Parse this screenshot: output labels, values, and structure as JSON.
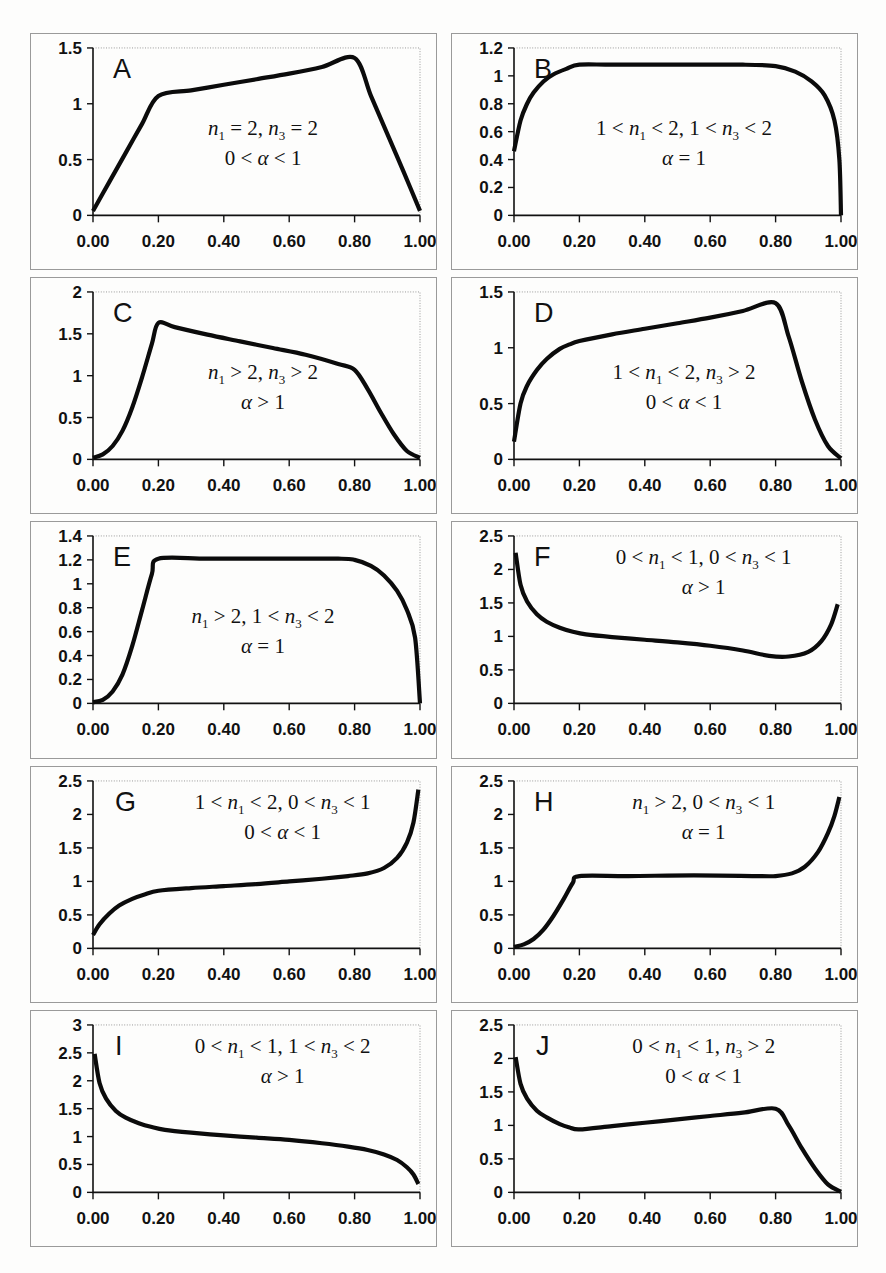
{
  "figure": {
    "background_color": "#fdfdfc",
    "curve_color": "#0b0b0b",
    "axis_color": "#111111",
    "frame_color": "#9a9a9a",
    "panel_count": 10,
    "columns": 2,
    "rows": 5
  },
  "chart_data": [
    {
      "id": "A",
      "type": "line",
      "letter": "A",
      "title": "",
      "xlabel": "",
      "ylabel": "",
      "xlim": [
        0.0,
        1.0
      ],
      "ylim": [
        0.0,
        1.5
      ],
      "xticks": [
        0.0,
        0.2,
        0.4,
        0.6,
        0.8,
        1.0
      ],
      "xtick_labels": [
        "0.00",
        "0.20",
        "0.40",
        "0.60",
        "0.80",
        "1.00"
      ],
      "yticks": [
        0,
        0.5,
        1,
        1.5
      ],
      "ytick_labels": [
        "0",
        "0.5",
        "1",
        "1.5"
      ],
      "grid": false,
      "legend": "none",
      "annotation_line1": "n₁ = 2, n₃ = 2",
      "annotation_line2": "0 < α < 1",
      "annotation_parts": [
        {
          "var1": "n",
          "sub1": "1",
          "rel1": " = 2, ",
          "var2": "n",
          "sub2": "3",
          "rel2": " = 2"
        },
        {
          "alpha_expr": "0 < α < 1"
        }
      ],
      "x": [
        0.0,
        0.05,
        0.1,
        0.15,
        0.2,
        0.3,
        0.4,
        0.5,
        0.6,
        0.7,
        0.8,
        0.85,
        0.9,
        0.95,
        1.0
      ],
      "y": [
        0.04,
        0.3,
        0.56,
        0.82,
        1.07,
        1.12,
        1.17,
        1.22,
        1.27,
        1.33,
        1.41,
        1.07,
        0.73,
        0.39,
        0.04
      ]
    },
    {
      "id": "B",
      "type": "line",
      "letter": "B",
      "title": "",
      "xlabel": "",
      "ylabel": "",
      "xlim": [
        0.0,
        1.0
      ],
      "ylim": [
        0.0,
        1.2
      ],
      "xticks": [
        0.0,
        0.2,
        0.4,
        0.6,
        0.8,
        1.0
      ],
      "xtick_labels": [
        "0.00",
        "0.20",
        "0.40",
        "0.60",
        "0.80",
        "1.00"
      ],
      "yticks": [
        0,
        0.2,
        0.4,
        0.6,
        0.8,
        1,
        1.2
      ],
      "ytick_labels": [
        "0",
        "0.2",
        "0.4",
        "0.6",
        "0.8",
        "1",
        "1.2"
      ],
      "grid": false,
      "legend": "none",
      "annotation_line1": "1 < n₁ < 2, 1 < n₃ < 2",
      "annotation_line2": "α = 1",
      "annotation_parts": [
        {
          "pre1": "1 < ",
          "var1": "n",
          "sub1": "1",
          "rel1": " < 2, 1 < ",
          "var2": "n",
          "sub2": "3",
          "rel2": " < 2"
        },
        {
          "alpha_expr": "α = 1"
        }
      ],
      "x": [
        0.0,
        0.02,
        0.04,
        0.06,
        0.09,
        0.12,
        0.16,
        0.2,
        0.3,
        0.5,
        0.7,
        0.8,
        0.86,
        0.91,
        0.95,
        0.98,
        0.995,
        1.0
      ],
      "y": [
        0.46,
        0.68,
        0.8,
        0.88,
        0.96,
        1.01,
        1.05,
        1.08,
        1.08,
        1.08,
        1.08,
        1.07,
        1.03,
        0.96,
        0.86,
        0.68,
        0.4,
        0.0
      ]
    },
    {
      "id": "C",
      "type": "line",
      "letter": "C",
      "title": "",
      "xlabel": "",
      "ylabel": "",
      "xlim": [
        0.0,
        1.0
      ],
      "ylim": [
        0.0,
        2.0
      ],
      "xticks": [
        0.0,
        0.2,
        0.4,
        0.6,
        0.8,
        1.0
      ],
      "xtick_labels": [
        "0.00",
        "0.20",
        "0.40",
        "0.60",
        "0.80",
        "1.00"
      ],
      "yticks": [
        0,
        0.5,
        1,
        1.5,
        2
      ],
      "ytick_labels": [
        "0",
        "0.5",
        "1",
        "1.5",
        "2"
      ],
      "grid": false,
      "legend": "none",
      "annotation_line1": "n₁ > 2, n₃ > 2",
      "annotation_line2": "α > 1",
      "annotation_parts": [
        {
          "var1": "n",
          "sub1": "1",
          "rel1": " > 2, ",
          "var2": "n",
          "sub2": "3",
          "rel2": " > 2"
        },
        {
          "alpha_expr": "α > 1"
        }
      ],
      "x": [
        0.0,
        0.03,
        0.06,
        0.09,
        0.12,
        0.15,
        0.18,
        0.2,
        0.25,
        0.35,
        0.45,
        0.55,
        0.65,
        0.75,
        0.8,
        0.84,
        0.88,
        0.92,
        0.96,
        1.0
      ],
      "y": [
        0.02,
        0.06,
        0.16,
        0.34,
        0.62,
        0.98,
        1.38,
        1.63,
        1.58,
        1.49,
        1.41,
        1.33,
        1.25,
        1.14,
        1.07,
        0.84,
        0.56,
        0.3,
        0.1,
        0.02
      ]
    },
    {
      "id": "D",
      "type": "line",
      "letter": "D",
      "title": "",
      "xlabel": "",
      "ylabel": "",
      "xlim": [
        0.0,
        1.0
      ],
      "ylim": [
        0.0,
        1.5
      ],
      "xticks": [
        0.0,
        0.2,
        0.4,
        0.6,
        0.8,
        1.0
      ],
      "xtick_labels": [
        "0.00",
        "0.20",
        "0.40",
        "0.60",
        "0.80",
        "1.00"
      ],
      "yticks": [
        0,
        0.5,
        1,
        1.5
      ],
      "ytick_labels": [
        "0",
        "0.5",
        "1",
        "1.5"
      ],
      "grid": false,
      "legend": "none",
      "annotation_line1": "1 < n₁ < 2, n₃ > 2",
      "annotation_line2": "0 < α < 1",
      "annotation_parts": [
        {
          "pre1": "1 < ",
          "var1": "n",
          "sub1": "1",
          "rel1": " < 2, ",
          "var2": "n",
          "sub2": "3",
          "rel2": " > 2"
        },
        {
          "alpha_expr": "0 < α < 1"
        }
      ],
      "x": [
        0.0,
        0.02,
        0.04,
        0.07,
        0.1,
        0.14,
        0.17,
        0.2,
        0.3,
        0.4,
        0.5,
        0.6,
        0.7,
        0.8,
        0.84,
        0.88,
        0.92,
        0.96,
        1.0
      ],
      "y": [
        0.16,
        0.5,
        0.66,
        0.8,
        0.9,
        0.99,
        1.03,
        1.06,
        1.12,
        1.17,
        1.22,
        1.27,
        1.33,
        1.4,
        1.1,
        0.7,
        0.36,
        0.12,
        0.01
      ]
    },
    {
      "id": "E",
      "type": "line",
      "letter": "E",
      "title": "",
      "xlabel": "",
      "ylabel": "",
      "xlim": [
        0.0,
        1.0
      ],
      "ylim": [
        0.0,
        1.4
      ],
      "xticks": [
        0.0,
        0.2,
        0.4,
        0.6,
        0.8,
        1.0
      ],
      "xtick_labels": [
        "0.00",
        "0.20",
        "0.40",
        "0.60",
        "0.80",
        "1.00"
      ],
      "yticks": [
        0,
        0.2,
        0.4,
        0.6,
        0.8,
        1,
        1.2,
        1.4
      ],
      "ytick_labels": [
        "0",
        "0.2",
        "0.4",
        "0.6",
        "0.8",
        "1",
        "1.2",
        "1.4"
      ],
      "grid": false,
      "legend": "none",
      "annotation_line1": "n₁ > 2, 1 < n₃ < 2",
      "annotation_line2": "α = 1",
      "annotation_parts": [
        {
          "var1": "n",
          "sub1": "1",
          "rel1": " > 2, 1 < ",
          "var2": "n",
          "sub2": "3",
          "rel2": " < 2"
        },
        {
          "alpha_expr": "α = 1"
        }
      ],
      "x": [
        0.0,
        0.03,
        0.06,
        0.09,
        0.12,
        0.15,
        0.18,
        0.2,
        0.35,
        0.55,
        0.75,
        0.8,
        0.85,
        0.89,
        0.93,
        0.96,
        0.985,
        1.0
      ],
      "y": [
        0.01,
        0.03,
        0.1,
        0.24,
        0.48,
        0.78,
        1.08,
        1.21,
        1.21,
        1.21,
        1.21,
        1.2,
        1.15,
        1.07,
        0.94,
        0.78,
        0.55,
        0.0
      ]
    },
    {
      "id": "F",
      "type": "line",
      "letter": "F",
      "title": "",
      "xlabel": "",
      "ylabel": "",
      "xlim": [
        0.0,
        1.0
      ],
      "ylim": [
        0.0,
        2.5
      ],
      "xticks": [
        0.0,
        0.2,
        0.4,
        0.6,
        0.8,
        1.0
      ],
      "xtick_labels": [
        "0.00",
        "0.20",
        "0.40",
        "0.60",
        "0.80",
        "1.00"
      ],
      "yticks": [
        0,
        0.5,
        1,
        1.5,
        2,
        2.5
      ],
      "ytick_labels": [
        "0",
        "0.5",
        "1",
        "1.5",
        "2",
        "2.5"
      ],
      "grid": false,
      "legend": "none",
      "annotation_line1": "0 < n₁ < 1, 0 < n₃ < 1",
      "annotation_line2": "α > 1",
      "annotation_parts": [
        {
          "pre1": "0 < ",
          "var1": "n",
          "sub1": "1",
          "rel1": " < 1, 0 < ",
          "var2": "n",
          "sub2": "3",
          "rel2": " < 1"
        },
        {
          "alpha_expr": "α > 1"
        }
      ],
      "x": [
        0.005,
        0.02,
        0.04,
        0.07,
        0.1,
        0.14,
        0.18,
        0.22,
        0.3,
        0.4,
        0.5,
        0.6,
        0.7,
        0.78,
        0.84,
        0.9,
        0.94,
        0.97,
        0.99
      ],
      "y": [
        2.25,
        1.77,
        1.52,
        1.33,
        1.22,
        1.13,
        1.07,
        1.03,
        0.99,
        0.95,
        0.91,
        0.86,
        0.79,
        0.71,
        0.7,
        0.77,
        0.93,
        1.18,
        1.48
      ]
    },
    {
      "id": "G",
      "type": "line",
      "letter": "G",
      "title": "",
      "xlabel": "",
      "ylabel": "",
      "xlim": [
        0.0,
        1.0
      ],
      "ylim": [
        0.0,
        2.5
      ],
      "xticks": [
        0.0,
        0.2,
        0.4,
        0.6,
        0.8,
        1.0
      ],
      "xtick_labels": [
        "0.00",
        "0.20",
        "0.40",
        "0.60",
        "0.80",
        "1.00"
      ],
      "yticks": [
        0,
        0.5,
        1,
        1.5,
        2,
        2.5
      ],
      "ytick_labels": [
        "0",
        "0.5",
        "1",
        "1.5",
        "2",
        "2.5"
      ],
      "grid": false,
      "legend": "none",
      "annotation_line1": "1 < n₁ < 2, 0 < n₃ < 1",
      "annotation_line2": "0 < α < 1",
      "annotation_parts": [
        {
          "pre1": "1 < ",
          "var1": "n",
          "sub1": "1",
          "rel1": " < 2, 0 < ",
          "var2": "n",
          "sub2": "3",
          "rel2": " < 1"
        },
        {
          "alpha_expr": "0 < α < 1"
        }
      ],
      "x": [
        0.0,
        0.02,
        0.05,
        0.08,
        0.12,
        0.16,
        0.2,
        0.3,
        0.4,
        0.5,
        0.6,
        0.7,
        0.78,
        0.84,
        0.89,
        0.93,
        0.96,
        0.98,
        0.995
      ],
      "y": [
        0.2,
        0.36,
        0.52,
        0.64,
        0.74,
        0.81,
        0.86,
        0.9,
        0.93,
        0.96,
        1.0,
        1.04,
        1.08,
        1.12,
        1.2,
        1.35,
        1.58,
        1.88,
        2.37
      ]
    },
    {
      "id": "H",
      "type": "line",
      "letter": "H",
      "title": "",
      "xlabel": "",
      "ylabel": "",
      "xlim": [
        0.0,
        1.0
      ],
      "ylim": [
        0.0,
        2.5
      ],
      "xticks": [
        0.0,
        0.2,
        0.4,
        0.6,
        0.8,
        1.0
      ],
      "xtick_labels": [
        "0.00",
        "0.20",
        "0.40",
        "0.60",
        "0.80",
        "1.00"
      ],
      "yticks": [
        0,
        0.5,
        1,
        1.5,
        2,
        2.5
      ],
      "ytick_labels": [
        "0",
        "0.5",
        "1",
        "1.5",
        "2",
        "2.5"
      ],
      "grid": false,
      "legend": "none",
      "annotation_line1": "n₁ > 2, 0 < n₃ < 1",
      "annotation_line2": "α = 1",
      "annotation_parts": [
        {
          "var1": "n",
          "sub1": "1",
          "rel1": " > 2, 0 < ",
          "var2": "n",
          "sub2": "3",
          "rel2": " < 1"
        },
        {
          "alpha_expr": "α = 1"
        }
      ],
      "x": [
        0.0,
        0.03,
        0.06,
        0.09,
        0.12,
        0.15,
        0.18,
        0.2,
        0.35,
        0.55,
        0.75,
        0.8,
        0.85,
        0.89,
        0.93,
        0.96,
        0.98,
        0.995
      ],
      "y": [
        0.02,
        0.06,
        0.14,
        0.28,
        0.48,
        0.72,
        0.98,
        1.08,
        1.08,
        1.09,
        1.08,
        1.08,
        1.12,
        1.22,
        1.44,
        1.72,
        1.98,
        2.26
      ]
    },
    {
      "id": "I",
      "type": "line",
      "letter": "I",
      "title": "",
      "xlabel": "",
      "ylabel": "",
      "xlim": [
        0.0,
        1.0
      ],
      "ylim": [
        0.0,
        3.0
      ],
      "xticks": [
        0.0,
        0.2,
        0.4,
        0.6,
        0.8,
        1.0
      ],
      "xtick_labels": [
        "0.00",
        "0.20",
        "0.40",
        "0.60",
        "0.80",
        "1.00"
      ],
      "yticks": [
        0,
        0.5,
        1,
        1.5,
        2,
        2.5,
        3
      ],
      "ytick_labels": [
        "0",
        "0.5",
        "1",
        "1.5",
        "2",
        "2.5",
        "3"
      ],
      "grid": false,
      "legend": "none",
      "annotation_line1": "0 < n₁ < 1, 1 < n₃ < 2",
      "annotation_line2": "α > 1",
      "annotation_parts": [
        {
          "pre1": "0 < ",
          "var1": "n",
          "sub1": "1",
          "rel1": " < 1, 1 < ",
          "var2": "n",
          "sub2": "3",
          "rel2": " < 2"
        },
        {
          "alpha_expr": "α > 1"
        }
      ],
      "x": [
        0.005,
        0.02,
        0.04,
        0.07,
        0.1,
        0.14,
        0.18,
        0.22,
        0.3,
        0.4,
        0.5,
        0.6,
        0.7,
        0.78,
        0.84,
        0.89,
        0.93,
        0.96,
        0.98,
        0.995
      ],
      "y": [
        2.48,
        1.96,
        1.68,
        1.46,
        1.34,
        1.24,
        1.17,
        1.12,
        1.07,
        1.02,
        0.98,
        0.94,
        0.88,
        0.82,
        0.76,
        0.68,
        0.58,
        0.45,
        0.32,
        0.15
      ]
    },
    {
      "id": "J",
      "type": "line",
      "letter": "J",
      "title": "",
      "xlabel": "",
      "ylabel": "",
      "xlim": [
        0.0,
        1.0
      ],
      "ylim": [
        0.0,
        2.5
      ],
      "xticks": [
        0.0,
        0.2,
        0.4,
        0.6,
        0.8,
        1.0
      ],
      "xtick_labels": [
        "0.00",
        "0.20",
        "0.40",
        "0.60",
        "0.80",
        "1.00"
      ],
      "yticks": [
        0,
        0.5,
        1,
        1.5,
        2,
        2.5
      ],
      "ytick_labels": [
        "0",
        "0.5",
        "1",
        "1.5",
        "2",
        "2.5"
      ],
      "grid": false,
      "legend": "none",
      "annotation_line1": "0 < n₁ < 1, n₃ > 2",
      "annotation_line2": "0 < α < 1",
      "annotation_parts": [
        {
          "pre1": "0 < ",
          "var1": "n",
          "sub1": "1",
          "rel1": " < 1, ",
          "var2": "n",
          "sub2": "3",
          "rel2": " > 2"
        },
        {
          "alpha_expr": "0 < α < 1"
        }
      ],
      "x": [
        0.005,
        0.02,
        0.04,
        0.07,
        0.1,
        0.14,
        0.17,
        0.2,
        0.3,
        0.4,
        0.5,
        0.6,
        0.7,
        0.8,
        0.84,
        0.88,
        0.92,
        0.96,
        1.0
      ],
      "y": [
        2.02,
        1.62,
        1.4,
        1.22,
        1.12,
        1.02,
        0.97,
        0.94,
        0.99,
        1.04,
        1.09,
        1.14,
        1.19,
        1.25,
        1.0,
        0.66,
        0.36,
        0.12,
        0.01
      ]
    }
  ]
}
